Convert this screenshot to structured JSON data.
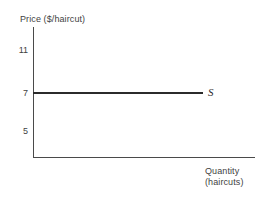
{
  "chart_data": {
    "type": "line",
    "title": "",
    "ylabel": "Price ($/haircut)",
    "xlabel": "Quantity (haircuts)",
    "xlabel_line1": "Quantity",
    "xlabel_line2": "(haircuts)",
    "ytick_labels": [
      "11",
      "7",
      "5"
    ],
    "ytick_values": [
      11,
      7,
      5
    ],
    "xtick_labels": [],
    "grid": false,
    "legend": "none",
    "series": [
      {
        "name": "S",
        "label": "S",
        "description": "perfectly elastic (horizontal) supply curve",
        "y_value": 7,
        "values": [
          7,
          7
        ],
        "color": "#2b2b2b"
      }
    ],
    "annotations": [
      {
        "text": "S",
        "target": "supply-curve",
        "position": "right-end"
      }
    ],
    "axis_color": "#4a4a4a",
    "text_color": "#3f3f3f"
  }
}
